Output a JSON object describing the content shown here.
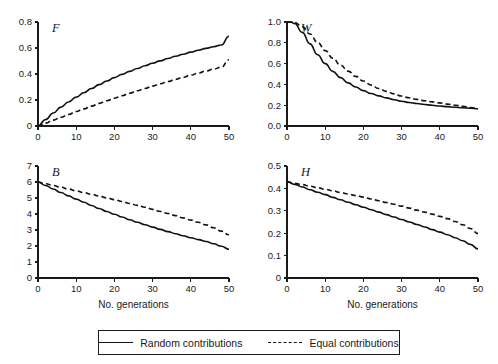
{
  "figure": {
    "background": "#ffffff",
    "line_color": "#111111",
    "axis_color": "#1a1a1a"
  },
  "legend": {
    "position": "bottom-center",
    "entries": [
      {
        "label": "Random contributions",
        "style": "solid",
        "swatch": "solid-line-swatch"
      },
      {
        "label": "Equal contributions",
        "style": "dashed",
        "swatch": "dashed-line-swatch"
      }
    ]
  },
  "chart_data": [
    {
      "type": "line",
      "title": "F",
      "panel": "top-left",
      "xlabel": "",
      "ylabel": "",
      "xlim": [
        0,
        50
      ],
      "ylim": [
        0,
        0.8
      ],
      "xticks": [
        0,
        10,
        20,
        30,
        40,
        50
      ],
      "xticklabels": [
        "0",
        "10",
        "20",
        "30",
        "40",
        "50"
      ],
      "yticks": [
        0,
        0.2,
        0.4,
        0.6,
        0.8
      ],
      "yticklabels": [
        "0",
        "0.2",
        "0.4",
        "0.6",
        "0.8"
      ],
      "grid": false,
      "x": [
        0,
        2,
        4,
        6,
        8,
        10,
        12,
        14,
        16,
        18,
        20,
        22,
        24,
        26,
        28,
        30,
        32,
        34,
        36,
        38,
        40,
        42,
        44,
        46,
        48,
        50
      ],
      "series": [
        {
          "name": "Random contributions",
          "style": "solid",
          "values": [
            0.0,
            0.05,
            0.1,
            0.145,
            0.185,
            0.222,
            0.256,
            0.288,
            0.318,
            0.346,
            0.372,
            0.397,
            0.42,
            0.442,
            0.463,
            0.483,
            0.501,
            0.519,
            0.536,
            0.552,
            0.568,
            0.583,
            0.597,
            0.61,
            0.623,
            0.69
          ]
        },
        {
          "name": "Equal contributions",
          "style": "dashed",
          "values": [
            0.0,
            0.022,
            0.045,
            0.067,
            0.089,
            0.111,
            0.132,
            0.153,
            0.174,
            0.194,
            0.214,
            0.233,
            0.252,
            0.271,
            0.289,
            0.307,
            0.325,
            0.342,
            0.359,
            0.375,
            0.391,
            0.407,
            0.423,
            0.438,
            0.452,
            0.51
          ]
        }
      ]
    },
    {
      "type": "line",
      "title": "W",
      "panel": "top-right",
      "xlabel": "",
      "ylabel": "",
      "xlim": [
        0,
        50
      ],
      "ylim": [
        0,
        1.0
      ],
      "xticks": [
        0,
        10,
        20,
        30,
        40,
        50
      ],
      "xticklabels": [
        "0",
        "10",
        "20",
        "30",
        "40",
        "50"
      ],
      "yticks": [
        0.0,
        0.2,
        0.4,
        0.6,
        0.8,
        1.0
      ],
      "yticklabels": [
        "0.0",
        "0.2",
        "0.4",
        "0.6",
        "0.8",
        "1.0"
      ],
      "grid": false,
      "x": [
        0,
        1,
        2,
        4,
        6,
        8,
        10,
        12,
        14,
        16,
        18,
        20,
        22,
        24,
        26,
        28,
        30,
        32,
        34,
        36,
        38,
        40,
        42,
        44,
        46,
        48,
        50
      ],
      "series": [
        {
          "name": "Random contributions",
          "style": "solid",
          "values": [
            1.0,
            1.0,
            0.985,
            0.9,
            0.79,
            0.685,
            0.6,
            0.525,
            0.465,
            0.415,
            0.375,
            0.34,
            0.313,
            0.29,
            0.27,
            0.253,
            0.238,
            0.226,
            0.216,
            0.207,
            0.199,
            0.192,
            0.186,
            0.181,
            0.176,
            0.171,
            0.166
          ]
        },
        {
          "name": "Equal contributions",
          "style": "dashed",
          "values": [
            1.0,
            1.0,
            0.995,
            0.955,
            0.885,
            0.805,
            0.725,
            0.652,
            0.586,
            0.528,
            0.477,
            0.432,
            0.394,
            0.361,
            0.333,
            0.309,
            0.288,
            0.271,
            0.256,
            0.243,
            0.232,
            0.222,
            0.21,
            0.2,
            0.19,
            0.178,
            0.166
          ]
        }
      ]
    },
    {
      "type": "line",
      "title": "B",
      "panel": "bottom-left",
      "xlabel": "No. generations",
      "ylabel": "",
      "xlim": [
        0,
        50
      ],
      "ylim": [
        0,
        7
      ],
      "xticks": [
        0,
        10,
        20,
        30,
        40,
        50
      ],
      "xticklabels": [
        "0",
        "10",
        "20",
        "30",
        "40",
        "50"
      ],
      "yticks": [
        0,
        1,
        2,
        3,
        4,
        5,
        6,
        7
      ],
      "yticklabels": [
        "0",
        "1",
        "2",
        "3",
        "4",
        "5",
        "6",
        "7"
      ],
      "grid": false,
      "x": [
        0,
        2,
        4,
        6,
        8,
        10,
        12,
        14,
        16,
        18,
        20,
        22,
        24,
        26,
        28,
        30,
        32,
        34,
        36,
        38,
        40,
        42,
        44,
        46,
        48,
        50
      ],
      "series": [
        {
          "name": "Random contributions",
          "style": "solid",
          "values": [
            6.0,
            5.78,
            5.56,
            5.34,
            5.13,
            4.93,
            4.73,
            4.53,
            4.34,
            4.16,
            3.98,
            3.81,
            3.64,
            3.48,
            3.33,
            3.18,
            3.04,
            2.9,
            2.77,
            2.64,
            2.52,
            2.4,
            2.28,
            2.14,
            1.98,
            1.8
          ]
        },
        {
          "name": "Equal contributions",
          "style": "dashed",
          "values": [
            6.0,
            5.89,
            5.78,
            5.67,
            5.56,
            5.45,
            5.34,
            5.23,
            5.12,
            5.01,
            4.9,
            4.78,
            4.66,
            4.54,
            4.42,
            4.29,
            4.16,
            4.03,
            3.9,
            3.76,
            3.62,
            3.48,
            3.32,
            3.14,
            2.93,
            2.7
          ]
        }
      ]
    },
    {
      "type": "line",
      "title": "H",
      "panel": "bottom-right",
      "xlabel": "No. generations",
      "ylabel": "",
      "xlim": [
        0,
        50
      ],
      "ylim": [
        0,
        0.5
      ],
      "xticks": [
        0,
        10,
        20,
        30,
        40,
        50
      ],
      "xticklabels": [
        "0",
        "10",
        "20",
        "30",
        "40",
        "50"
      ],
      "yticks": [
        0,
        0.1,
        0.2,
        0.3,
        0.4,
        0.5
      ],
      "yticklabels": [
        "0",
        "0.1",
        "0.2",
        "0.3",
        "0.4",
        "0.5"
      ],
      "grid": false,
      "x": [
        0,
        2,
        4,
        6,
        8,
        10,
        12,
        14,
        16,
        18,
        20,
        22,
        24,
        26,
        28,
        30,
        32,
        34,
        36,
        38,
        40,
        42,
        44,
        46,
        48,
        50
      ],
      "series": [
        {
          "name": "Random contributions",
          "style": "solid",
          "values": [
            0.43,
            0.418,
            0.406,
            0.394,
            0.383,
            0.372,
            0.36,
            0.349,
            0.338,
            0.327,
            0.316,
            0.305,
            0.294,
            0.283,
            0.272,
            0.261,
            0.25,
            0.239,
            0.228,
            0.216,
            0.205,
            0.193,
            0.18,
            0.166,
            0.15,
            0.13
          ]
        },
        {
          "name": "Equal contributions",
          "style": "dashed",
          "values": [
            0.43,
            0.423,
            0.417,
            0.41,
            0.403,
            0.396,
            0.389,
            0.382,
            0.375,
            0.368,
            0.361,
            0.353,
            0.345,
            0.337,
            0.329,
            0.321,
            0.312,
            0.303,
            0.294,
            0.285,
            0.275,
            0.265,
            0.252,
            0.238,
            0.221,
            0.198
          ]
        }
      ]
    }
  ]
}
